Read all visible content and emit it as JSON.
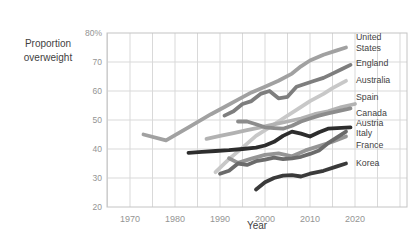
{
  "chart_data": {
    "type": "line",
    "xlabel": "Year",
    "ylabel_lines": [
      "Proportion",
      "overweight"
    ],
    "ylim": [
      20,
      80
    ],
    "xlim_years": [
      1965,
      2031.5
    ],
    "x_ticks": [
      1970,
      1980,
      1990,
      2000,
      2010,
      2020
    ],
    "y_ticks": [
      {
        "value": 80,
        "label": "80%"
      },
      {
        "value": 70,
        "label": "70"
      },
      {
        "value": 60,
        "label": "60"
      },
      {
        "value": 50,
        "label": "50"
      },
      {
        "value": 40,
        "label": "40"
      },
      {
        "value": 30,
        "label": "30"
      },
      {
        "value": 20,
        "label": "20"
      }
    ],
    "grid": {
      "x_step_years": 5,
      "y_step": 10,
      "on": true
    },
    "grid_color": "#d9d9d9",
    "border_color": "#c4c4c4",
    "tick_color": "#949494",
    "text_color": "#3f3f3f",
    "legend_position": "right-inside",
    "draw_order": [
      "Australia",
      "Spain",
      "France",
      "United States",
      "Canada",
      "England",
      "Italy",
      "Korea",
      "Austria"
    ],
    "series": [
      {
        "name": "United States",
        "label_lines": [
          "United",
          "States"
        ],
        "label_y": 76.8,
        "color": "#a1a1a1",
        "points": [
          [
            1973,
            45
          ],
          [
            1978,
            43
          ],
          [
            1983,
            47.5
          ],
          [
            1988,
            52
          ],
          [
            1991,
            54.5
          ],
          [
            1994,
            57
          ],
          [
            1997,
            59.5
          ],
          [
            2000,
            61.5
          ],
          [
            2003,
            63.5
          ],
          [
            2006,
            66
          ],
          [
            2008,
            68.5
          ],
          [
            2010,
            70.5
          ],
          [
            2013,
            72.5
          ],
          [
            2016,
            74
          ],
          [
            2018,
            75
          ]
        ]
      },
      {
        "name": "England",
        "label_lines": [
          "England"
        ],
        "label_y": 69.6,
        "color": "#7e7e7e",
        "points": [
          [
            1991,
            51.5
          ],
          [
            1993,
            53
          ],
          [
            1995,
            55.5
          ],
          [
            1997,
            56.5
          ],
          [
            1999,
            59
          ],
          [
            2001,
            60
          ],
          [
            2003,
            57.5
          ],
          [
            2005,
            58
          ],
          [
            2007,
            61.5
          ],
          [
            2009,
            62.5
          ],
          [
            2011,
            63.5
          ],
          [
            2013,
            64.5
          ],
          [
            2015,
            66
          ],
          [
            2017,
            67.5
          ],
          [
            2019,
            69
          ]
        ]
      },
      {
        "name": "Australia",
        "label_lines": [
          "Australia"
        ],
        "label_y": 63.8,
        "color": "#c8c8c8",
        "points": [
          [
            1989,
            32
          ],
          [
            1992,
            36.5
          ],
          [
            1995,
            40.5
          ],
          [
            1998,
            44.5
          ],
          [
            2001,
            47.5
          ],
          [
            2004,
            50.5
          ],
          [
            2007,
            53.5
          ],
          [
            2010,
            56.5
          ],
          [
            2013,
            59
          ],
          [
            2015,
            61
          ],
          [
            2018,
            63.5
          ]
        ]
      },
      {
        "name": "Spain",
        "label_lines": [
          "Spain"
        ],
        "label_y": 57.8,
        "color": "#b2b2b2",
        "points": [
          [
            1987,
            43.5
          ],
          [
            1990,
            44.5
          ],
          [
            1993,
            45.5
          ],
          [
            1996,
            46.5
          ],
          [
            1999,
            47.5
          ],
          [
            2002,
            48.5
          ],
          [
            2005,
            49.5
          ],
          [
            2008,
            50.5
          ],
          [
            2011,
            52
          ],
          [
            2014,
            53
          ],
          [
            2017,
            54.5
          ],
          [
            2020,
            55.5
          ]
        ]
      },
      {
        "name": "Canada",
        "label_lines": [
          "Canada"
        ],
        "label_y": 52.3,
        "color": "#8c8c8c",
        "points": [
          [
            1994,
            49.5
          ],
          [
            1996,
            49.5
          ],
          [
            1998,
            48.5
          ],
          [
            2000,
            47.5
          ],
          [
            2002,
            47.2
          ],
          [
            2004,
            47
          ],
          [
            2006,
            48
          ],
          [
            2008,
            49.5
          ],
          [
            2010,
            50.5
          ],
          [
            2012,
            51.5
          ],
          [
            2014,
            52.3
          ],
          [
            2016,
            53
          ],
          [
            2019,
            54
          ]
        ]
      },
      {
        "name": "Austria",
        "label_lines": [
          "Austria"
        ],
        "label_y": 48.9,
        "color": "#2d2d2d",
        "points": [
          [
            1983,
            38.7
          ],
          [
            1986,
            39
          ],
          [
            1989,
            39.3
          ],
          [
            1992,
            39.6
          ],
          [
            1995,
            40
          ],
          [
            1998,
            40.5
          ],
          [
            2000,
            41.2
          ],
          [
            2002,
            42.5
          ],
          [
            2004,
            44.5
          ],
          [
            2006,
            46
          ],
          [
            2008,
            45.3
          ],
          [
            2010,
            44.3
          ],
          [
            2012,
            45.8
          ],
          [
            2014,
            47
          ],
          [
            2016,
            47.2
          ],
          [
            2019,
            47.5
          ]
        ]
      },
      {
        "name": "Italy",
        "label_lines": [
          "Italy"
        ],
        "label_y": 45.4,
        "color": "#6b6b6b",
        "points": [
          [
            1990,
            31.5
          ],
          [
            1992,
            32.5
          ],
          [
            1994,
            35
          ],
          [
            1996,
            34.5
          ],
          [
            1998,
            35.8
          ],
          [
            2000,
            36.3
          ],
          [
            2002,
            37
          ],
          [
            2004,
            36.5
          ],
          [
            2006,
            36.8
          ],
          [
            2008,
            37.3
          ],
          [
            2010,
            38.3
          ],
          [
            2012,
            39.5
          ],
          [
            2014,
            42
          ],
          [
            2016,
            44
          ],
          [
            2018,
            46
          ]
        ]
      },
      {
        "name": "France",
        "label_lines": [
          "France"
        ],
        "label_y": 41.5,
        "color": "#959595",
        "points": [
          [
            1992,
            36.8
          ],
          [
            1994,
            35.2
          ],
          [
            1997,
            36.7
          ],
          [
            2000,
            38
          ],
          [
            2003,
            38.5
          ],
          [
            2006,
            37.5
          ],
          [
            2009,
            39.5
          ],
          [
            2012,
            41
          ],
          [
            2015,
            42.5
          ],
          [
            2018,
            44.3
          ]
        ]
      },
      {
        "name": "Korea",
        "label_lines": [
          "Korea"
        ],
        "label_y": 35.3,
        "color": "#3a3a3a",
        "points": [
          [
            1998,
            26
          ],
          [
            2000,
            28.5
          ],
          [
            2002,
            30
          ],
          [
            2004,
            30.8
          ],
          [
            2006,
            31
          ],
          [
            2008,
            30.5
          ],
          [
            2010,
            31.5
          ],
          [
            2013,
            32.5
          ],
          [
            2016,
            34
          ],
          [
            2018,
            35
          ]
        ]
      }
    ]
  }
}
